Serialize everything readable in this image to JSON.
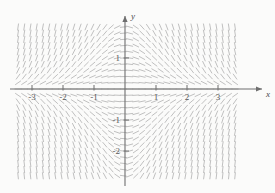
{
  "figure": {
    "type": "slope-field",
    "background_color": "#fbfbfa",
    "width": 275,
    "height": 193
  },
  "axes": {
    "x_axis": {
      "label": "x",
      "arrow": "right",
      "color": "#6e6e6e",
      "pixel_y": 89,
      "pixel_x_start": 10,
      "pixel_x_end": 262
    },
    "y_axis": {
      "label": "y",
      "arrow": "up",
      "color": "#6e6e6e",
      "pixel_x": 125,
      "pixel_y_start": 16,
      "pixel_y_end": 186
    },
    "unit_pixels": 31.0,
    "origin": {
      "x": 125,
      "y": 89
    }
  },
  "ticks": {
    "x_labels": [
      "-3",
      "-2",
      "-1",
      "1",
      "2",
      "3"
    ],
    "x_values": [
      -3,
      -2,
      -1,
      1,
      2,
      3
    ],
    "y_labels": [
      "1",
      "-1",
      "-2"
    ],
    "y_values": [
      1,
      -1,
      -2
    ]
  },
  "chart_data": {
    "type": "scatter",
    "title": "",
    "xlabel": "x",
    "ylabel": "y",
    "xlim": [
      -3.7,
      3.75
    ],
    "ylim": [
      -3.05,
      2.35
    ],
    "grid": false,
    "legend": null,
    "field": {
      "description": "direction field of dy/dx = -x*y, segments drawn on a lattice",
      "slope_formula": "-x*y",
      "x_start": -3.65,
      "x_end": 3.7,
      "x_step": 0.2,
      "y_start": -3.0,
      "y_end": 2.3,
      "y_step": 0.2,
      "segment_length_px": 7,
      "segment_color": "#b9b9b9",
      "segment_width": 0.9
    }
  }
}
